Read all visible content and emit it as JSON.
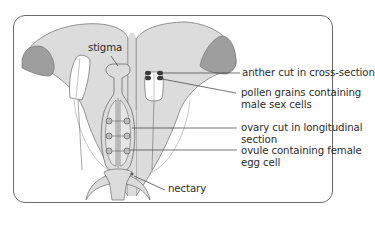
{
  "diagram": {
    "colors": {
      "petal_fill": "#dcdcdc",
      "petal_inner_fill": "#9e9e9e",
      "outline": "#6a6a6a",
      "text": "#2b2b2b",
      "frame_border": "#6a6a6a",
      "anther_fill": "#ffffff"
    },
    "labels": {
      "stigma": "stigma",
      "anther_line1": "anther cut in cross-section",
      "pollen_line1": "pollen grains containing",
      "pollen_line2": "male sex cells",
      "ovary_line1": "ovary cut in longitudinal",
      "ovary_line2": "section",
      "ovule_line1": "ovule containing female",
      "ovule_line2": "egg cell",
      "nectary": "nectary"
    }
  }
}
